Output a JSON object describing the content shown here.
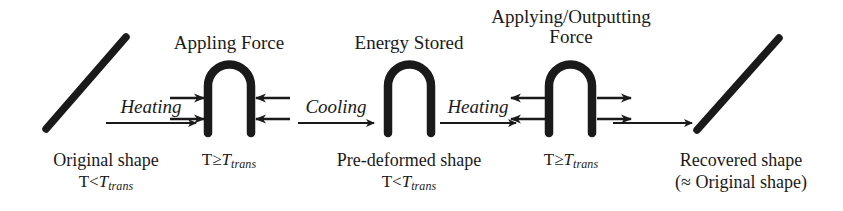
{
  "figure": {
    "type": "process-flow-diagram",
    "background_color": "#ffffff",
    "ink_color": "#1a1a1a"
  },
  "top_labels": [
    {
      "id": "appling-force",
      "text": "Appling Force",
      "lines": [
        "Appling Force"
      ]
    },
    {
      "id": "energy-stored",
      "text": "Energy Stored",
      "lines": [
        "Energy Stored"
      ]
    },
    {
      "id": "applying-outputting-force",
      "text": "Applying/Outputting Force",
      "lines": [
        "Applying/Outputting",
        "Force"
      ]
    }
  ],
  "process_labels": [
    {
      "id": "heating-1",
      "text": "Heating"
    },
    {
      "id": "cooling",
      "text": "Cooling"
    },
    {
      "id": "heating-2",
      "text": "Heating"
    }
  ],
  "states": [
    {
      "id": "original-shape",
      "name_lines": [
        "Original shape"
      ],
      "temperature": {
        "symbol": "T",
        "relation": "<",
        "reference": "T",
        "subscript": "trans"
      },
      "shape": "straight-diagonal-bar"
    },
    {
      "id": "deformed-hot",
      "name_lines": [],
      "temperature": {
        "symbol": "T",
        "relation": "≥",
        "reference": "T",
        "subscript": "trans"
      },
      "shape": "inverted-u-arch",
      "force_direction": "inward"
    },
    {
      "id": "pre-deformed-shape",
      "name_lines": [
        "Pre-deformed shape"
      ],
      "temperature": {
        "symbol": "T",
        "relation": "<",
        "reference": "T",
        "subscript": "trans"
      },
      "shape": "inverted-u-arch",
      "force_direction": "none"
    },
    {
      "id": "recovering-hot",
      "name_lines": [],
      "temperature": {
        "symbol": "T",
        "relation": "≥",
        "reference": "T",
        "subscript": "trans"
      },
      "shape": "inverted-u-arch",
      "force_direction": "outward"
    },
    {
      "id": "recovered-shape",
      "name_lines": [
        "Recovered shape",
        "(≈ Original shape)"
      ],
      "temperature": null,
      "shape": "straight-diagonal-bar"
    }
  ]
}
